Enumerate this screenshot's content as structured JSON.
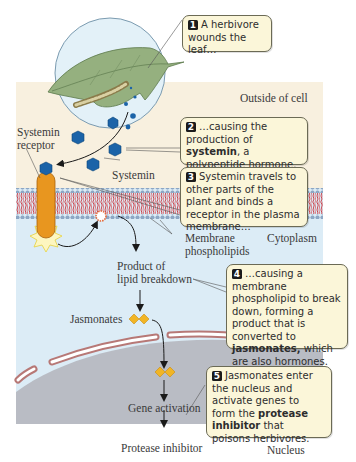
{
  "diagram": {
    "regions": {
      "outside": "Outside of cell",
      "cytoplasm": "Cytoplasm",
      "nucleus": "Nucleus"
    },
    "labels": {
      "receptor_line1": "Systemin",
      "receptor_line2": "receptor",
      "systemin": "Systemin",
      "membrane_line1": "Membrane",
      "membrane_line2": "phospholipids",
      "product_line1": "Product of",
      "product_line2": "lipid breakdown",
      "jasmonates": "Jasmonates",
      "gene_activation": "Gene activation",
      "protease_inhibitor": "Protease inhibitor"
    },
    "callouts": [
      {
        "num": "1",
        "pre": "A herbivore wounds the leaf…",
        "bold": "",
        "post": ""
      },
      {
        "num": "2",
        "pre": "…causing the production of ",
        "bold": "systemin",
        "post": ", a polypeptide hormone."
      },
      {
        "num": "3",
        "pre": "Systemin travels to other parts of the plant and binds a receptor in the plasma membrane…",
        "bold": "",
        "post": ""
      },
      {
        "num": "4",
        "pre": "…causing a membrane phospholipid to break down, forming a product that is converted to ",
        "bold": "jasmonates,",
        "post": " which are also hormones."
      },
      {
        "num": "5",
        "pre": "Jasmonates enter the nucleus and activate genes to form the ",
        "bold": "protease inhibitor",
        "post": " that poisons herbivores."
      }
    ],
    "colors": {
      "outside_bg": "#f8f0df",
      "cytoplasm_bg": "#dcecf6",
      "nucleus_bg": "#b9bcc4",
      "envelope": "#b77876",
      "callout_bg": "#fbf6d9",
      "systemin": "#1b63a8",
      "receptor": "#e8961f",
      "jasmonate": "#f1b525",
      "leaf": "#95b07f",
      "membrane_red": "#c9333b",
      "membrane_blue": "#8fa9c6"
    }
  }
}
